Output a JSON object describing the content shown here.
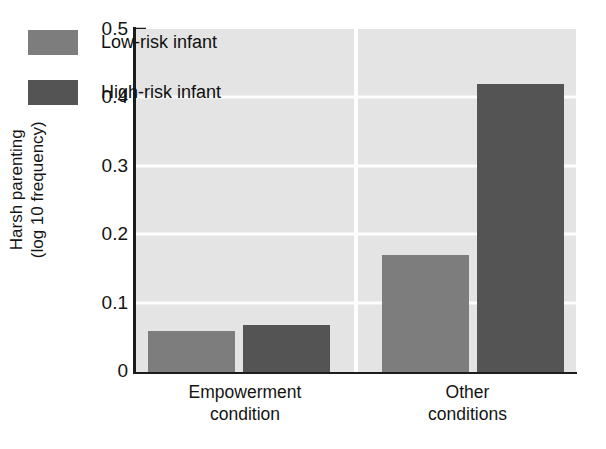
{
  "chart_data": {
    "type": "bar",
    "title": "",
    "subtitle": "",
    "xlabel": "",
    "ylabel_lines": [
      "Harsh parenting",
      "(log 10 frequency)"
    ],
    "ylabel": "Harsh parenting (log 10 frequency)",
    "categories": [
      "Empowerment condition",
      "Other conditions"
    ],
    "category_lines": [
      [
        "Empowerment",
        "condition"
      ],
      [
        "Other",
        "conditions"
      ]
    ],
    "series": [
      {
        "name": "Low-risk infant",
        "values": [
          0.06,
          0.17
        ],
        "color": "#7d7d7d"
      },
      {
        "name": "High-risk infant",
        "values": [
          0.068,
          0.42
        ],
        "color": "#545454"
      }
    ],
    "ylim": [
      0,
      0.5
    ],
    "yticks": [
      0.5,
      0.4,
      0.3,
      0.2,
      0.1,
      0
    ],
    "ytick_labels": [
      "0.5",
      "0.4",
      "0.3",
      "0.2",
      "0.1",
      "0"
    ],
    "gridlines": [
      0.4,
      0.3,
      0.2,
      0.1
    ],
    "grid": true,
    "grid_color": "#fdfdfd",
    "plot_background": "#e4e4e4",
    "axis_color": "#1c1c1c",
    "legend_position": "upper-left-inside",
    "legend_entries": [
      "Low-risk infant",
      "High-risk infant"
    ],
    "annotations": []
  }
}
